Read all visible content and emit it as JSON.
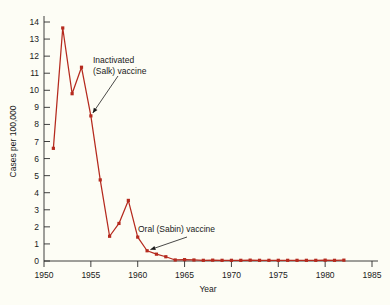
{
  "chart_data": {
    "type": "line",
    "title": "",
    "xlabel": "Year",
    "ylabel": "Cases per 100,000",
    "xlim": [
      1950,
      1985
    ],
    "ylim": [
      0,
      14
    ],
    "grid": false,
    "legend": "none",
    "line_color": "#b52a1e",
    "marker_color": "#b52a1e",
    "background_color": "#fdfdf5",
    "axis_color": "#2b2b2b",
    "xticks": [
      1950,
      1955,
      1960,
      1965,
      1970,
      1975,
      1980,
      1985
    ],
    "xtick_labels": [
      "1950",
      "1955",
      "1960",
      "1965",
      "1970",
      "1975",
      "1980",
      "1985"
    ],
    "yticks": [
      0,
      1,
      2,
      3,
      4,
      5,
      6,
      7,
      8,
      9,
      10,
      11,
      12,
      13,
      14
    ],
    "ytick_labels": [
      "0",
      "1",
      "2",
      "3",
      "4",
      "5",
      "6",
      "7",
      "8",
      "9",
      "10",
      "11",
      "12",
      "13",
      "14"
    ],
    "x": [
      1951,
      1952,
      1953,
      1954,
      1955,
      1956,
      1957,
      1958,
      1959,
      1960,
      1961,
      1962,
      1963,
      1964,
      1965,
      1966,
      1967,
      1968,
      1969,
      1970,
      1971,
      1972,
      1973,
      1974,
      1975,
      1976,
      1977,
      1978,
      1979,
      1980,
      1981,
      1982
    ],
    "values": [
      6.6,
      13.65,
      9.8,
      11.35,
      8.5,
      4.75,
      1.45,
      2.2,
      3.55,
      1.4,
      0.6,
      0.4,
      0.25,
      0.06,
      0.08,
      0.06,
      0.04,
      0.05,
      0.04,
      0.04,
      0.04,
      0.05,
      0.04,
      0.04,
      0.04,
      0.04,
      0.04,
      0.04,
      0.04,
      0.05,
      0.04,
      0.05
    ],
    "annotations": [
      {
        "text_line1": "Inactivated",
        "text_line2": "(Salk) vaccine",
        "points_to_x": 1955,
        "points_to_y": 8.5
      },
      {
        "text_line1": "Oral (Sabin) vaccine",
        "text_line2": "",
        "points_to_x": 1961,
        "points_to_y": 0.6
      }
    ]
  }
}
